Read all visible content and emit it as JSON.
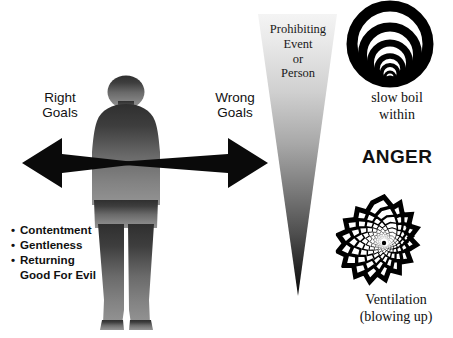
{
  "diagram": {
    "title_text": "ANGER",
    "labels": {
      "right_goals": "Right\nGoals",
      "wrong_goals": "Wrong\nGoals",
      "prohibiting": "Prohibiting\nEvent\nor\nPerson",
      "slow_boil": "slow boil\nwithin",
      "anger": "ANGER",
      "ventilation": "Ventilation\n(blowing up)"
    },
    "virtue_list": [
      "Contentment",
      "Gentleness",
      "Returning\nGood For Evil"
    ],
    "graphics": {
      "person_silhouette": "person-silhouette",
      "double_arrow": "double-headed-horizontal-arrow",
      "wedge": "inverted-triangle-wedge",
      "concentric_rings": "concentric-rings-graphic",
      "starburst": "starburst-explosion-graphic"
    },
    "colors": {
      "background": "#ffffff",
      "text": "#111111",
      "arrow": "#0a0a0a",
      "silhouette_top": "#3a3a3a",
      "silhouette_bottom": "#8c8c8c",
      "wedge_top": "#f2f2f2",
      "wedge_bottom": "#0c0c0c",
      "ink": "#000000"
    }
  }
}
